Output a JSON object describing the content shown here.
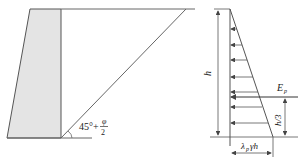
{
  "left_figure": {
    "name": "retaining-wall-with-sliding-wedge",
    "angle_label_main": "45°+",
    "angle_label_num": "φ",
    "angle_label_den": "2",
    "colors": {
      "wall_fill": "#e4e4e4",
      "line": "#555555"
    }
  },
  "right_figure": {
    "name": "passive-pressure-distribution",
    "height_label": "h",
    "resultant_label": "E",
    "resultant_sub": "p",
    "resultant_height_label": "h/3",
    "base_value_label_a": "λ",
    "base_value_label_sub": "p",
    "base_value_label_b": "γh",
    "arrow_count": 8
  }
}
